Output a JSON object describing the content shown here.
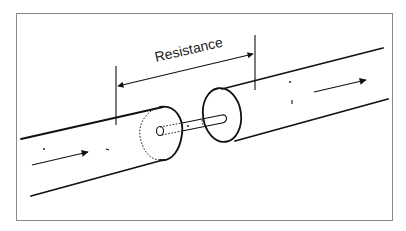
{
  "diagram": {
    "label": "Resistance",
    "elements": [
      "left cylinder (conductor segment)",
      "right cylinder (conductor segment)",
      "connecting pin",
      "dimension arrow spanning the joint",
      "flow arrows"
    ]
  },
  "colors": {
    "background": "#ffffff",
    "ink": "#111111",
    "frame": "#8a8a8a"
  }
}
